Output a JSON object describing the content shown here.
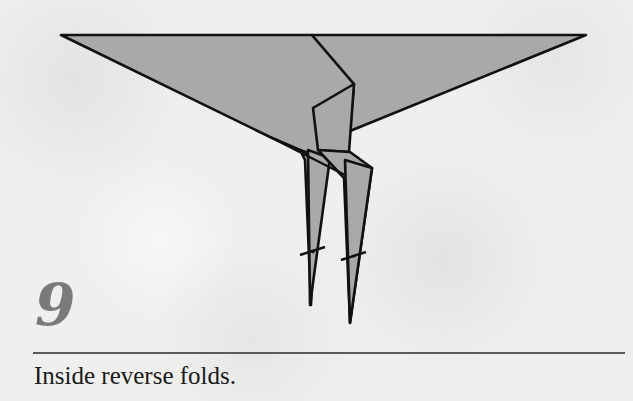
{
  "step": {
    "number": "9",
    "instruction": "Inside reverse folds."
  },
  "colors": {
    "paper_fill": "#a9a9a9",
    "line": "#111111",
    "number": "#7a7a7a",
    "separator": "#5a5a5a",
    "background": "#efefed"
  },
  "diagram": {
    "fold_marks": [
      "left-leg-reverse-fold",
      "right-leg-reverse-fold"
    ]
  }
}
